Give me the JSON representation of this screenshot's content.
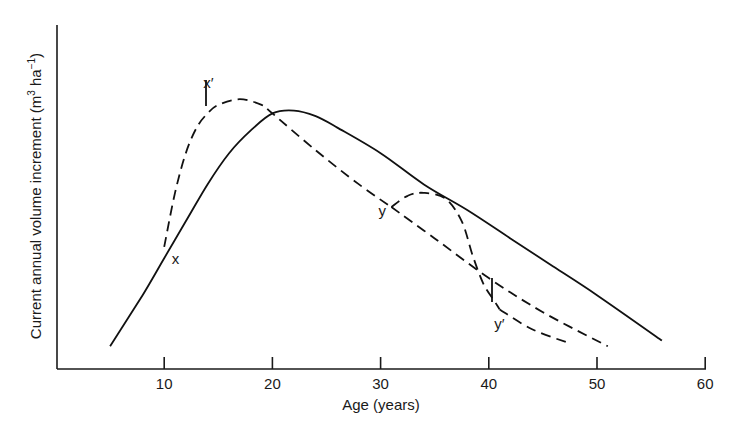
{
  "chart_data": {
    "type": "line",
    "title": "",
    "xlabel": "Age (years)",
    "ylabel_main": "Current annual volume increment (m",
    "ylabel_sup1": "3",
    "ylabel_mid": " ha",
    "ylabel_sup2": "−1",
    "ylabel_end": ")",
    "xlim": [
      0,
      60
    ],
    "x_ticks": [
      10,
      20,
      30,
      40,
      50,
      60
    ],
    "x_tick_labels": [
      "10",
      "20",
      "30",
      "40",
      "50",
      "60"
    ],
    "y_ticks": [],
    "grid": false,
    "legend": null,
    "series": [
      {
        "name": "normal CAI curve",
        "style": "solid",
        "x": [
          5,
          8,
          10,
          12,
          14,
          16,
          18,
          20,
          22,
          24,
          26,
          30,
          34,
          38,
          42,
          46,
          50,
          56
        ],
        "y_rel": [
          0.08,
          0.26,
          0.39,
          0.52,
          0.65,
          0.76,
          0.84,
          0.9,
          0.91,
          0.89,
          0.85,
          0.76,
          0.65,
          0.56,
          0.46,
          0.36,
          0.26,
          0.1
        ]
      },
      {
        "name": "response after treatment at x (age ~10)",
        "style": "dashed",
        "x": [
          10,
          11,
          12,
          13,
          14,
          15,
          17,
          19,
          20,
          24,
          28,
          31
        ],
        "y_rel": [
          0.43,
          0.62,
          0.76,
          0.85,
          0.9,
          0.93,
          0.95,
          0.93,
          0.9,
          0.77,
          0.65,
          0.57
        ]
      },
      {
        "name": "continuation of dashed trend after y",
        "style": "dashed",
        "x": [
          31,
          35,
          40,
          45,
          51
        ],
        "y_rel": [
          0.57,
          0.46,
          0.32,
          0.2,
          0.08
        ]
      },
      {
        "name": "response after treatment at y (age ~31)",
        "style": "dashed",
        "x": [
          31,
          32.5,
          34,
          36,
          37.5,
          38.5,
          39.5,
          40.5,
          41
        ],
        "y_rel": [
          0.57,
          0.61,
          0.62,
          0.6,
          0.52,
          0.4,
          0.3,
          0.24,
          0.21
        ]
      },
      {
        "name": "decline after y'",
        "style": "dashed",
        "x": [
          41,
          44,
          47.5
        ],
        "y_rel": [
          0.21,
          0.14,
          0.09
        ]
      }
    ],
    "annotations": [
      {
        "text": "x",
        "x": 10.7,
        "y_rel": 0.37
      },
      {
        "text": "x′",
        "x": 13.6,
        "y_rel": 0.99
      },
      {
        "text": "y",
        "x": 29.8,
        "y_rel": 0.54
      },
      {
        "text": "y′",
        "x": 40.5,
        "y_rel": 0.14
      }
    ]
  }
}
